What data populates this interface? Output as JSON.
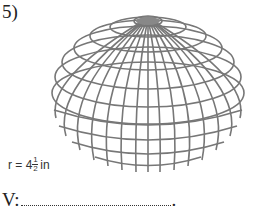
{
  "question": {
    "number": "5)",
    "figure": "sphere-wireframe",
    "radius": {
      "prefix": "r = 4",
      "fraction_numerator": "1",
      "fraction_denominator": "2",
      "unit": "in"
    },
    "answer": {
      "label": "V:",
      "terminator": "."
    }
  }
}
